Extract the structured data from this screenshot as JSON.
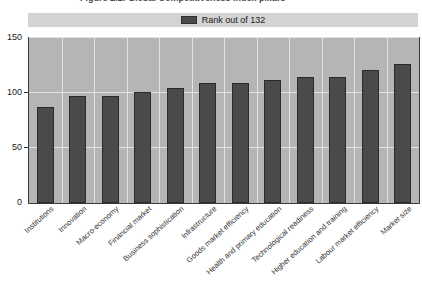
{
  "title": {
    "text": "Figure 2.1: Global Competitiveness Index pillars"
  },
  "legend": {
    "position": "top",
    "swatch_color": "#4a4a4a",
    "label": "Rank out of 132"
  },
  "axis": {
    "y_ticks": [
      "0",
      "50",
      "100",
      "150"
    ],
    "y_min": 0,
    "y_max": 150
  },
  "colors": {
    "bar_fill": "#4a4a4a",
    "bar_border": "#2b2b2b",
    "plot_background": "#b5b5b5",
    "legend_background": "#d3d3d3",
    "gridline": "#e2e2e2",
    "axis_line": "#3a3a3a",
    "page_background": "#ffffff"
  },
  "chart_data": {
    "type": "bar",
    "title": "Figure 2.1: Global Competitiveness Index pillars",
    "xlabel": "",
    "ylabel": "",
    "ylim": [
      0,
      150
    ],
    "yticks": [
      0,
      50,
      100,
      150
    ],
    "grid": true,
    "legend_position": "top",
    "series": [
      {
        "name": "Rank out of 132",
        "color": "#4a4a4a",
        "values": [
          87,
          97,
          97,
          101,
          105,
          109,
          109,
          112,
          115,
          115,
          121,
          126
        ]
      }
    ],
    "categories": [
      "Institutions",
      "Innovation",
      "Macro-economy",
      "Financial market",
      "Business sophistication",
      "Infrastructure",
      "Goods market efficiency",
      "Health and primary education",
      "Technological readiness",
      "Higher education and training",
      "Labour market efficiency",
      "Market size"
    ]
  }
}
